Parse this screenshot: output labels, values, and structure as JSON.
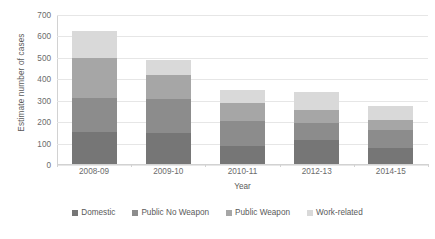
{
  "chart_data": {
    "type": "bar",
    "stacked": true,
    "title": "",
    "xlabel": "Year",
    "ylabel": "Estimate number of cases",
    "categories": [
      "2008-09",
      "2009-10",
      "2010-11",
      "2012-13",
      "2014-15"
    ],
    "ylim": [
      0,
      700
    ],
    "yticks": [
      0,
      100,
      200,
      300,
      400,
      500,
      600,
      700
    ],
    "ytick_labels": [
      "0",
      "100",
      "200",
      "300",
      "400",
      "500",
      "600",
      "700"
    ],
    "grid": true,
    "legend_position": "bottom",
    "series": [
      {
        "name": "Domestic",
        "color": "#767676",
        "values": [
          155,
          150,
          90,
          115,
          80
        ]
      },
      {
        "name": "Public No Weapon",
        "color": "#8c8c8c",
        "values": [
          160,
          160,
          115,
          80,
          85
        ]
      },
      {
        "name": "Public Weapon",
        "color": "#a6a6a6",
        "values": [
          185,
          110,
          85,
          60,
          45
        ]
      },
      {
        "name": "Work-related",
        "color": "#d9d9d9",
        "values": [
          125,
          70,
          60,
          85,
          65
        ]
      }
    ],
    "totals": [
      625,
      490,
      350,
      340,
      275
    ]
  },
  "legend": {
    "items": [
      {
        "label": "Domestic",
        "color": "#767676"
      },
      {
        "label": "Public No Weapon",
        "color": "#8c8c8c"
      },
      {
        "label": "Public Weapon",
        "color": "#a6a6a6"
      },
      {
        "label": "Work-related",
        "color": "#d9d9d9"
      }
    ]
  },
  "axes": {
    "y_title": "Estimate number of cases",
    "x_title": "Year"
  }
}
